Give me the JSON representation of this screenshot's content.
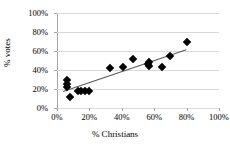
{
  "chart_data": {
    "type": "scatter",
    "title": "",
    "xlabel": "% Christians",
    "ylabel": "% votes",
    "xlim": [
      0,
      100
    ],
    "ylim": [
      0,
      100
    ],
    "xticks": [
      "0%",
      "20%",
      "40%",
      "60%",
      "80%",
      "100%"
    ],
    "yticks": [
      "0%",
      "20%",
      "40%",
      "60%",
      "80%",
      "100%"
    ],
    "xtick_values": [
      0,
      20,
      40,
      60,
      80,
      100
    ],
    "ytick_values": [
      0,
      20,
      40,
      60,
      80,
      100
    ],
    "grid": "horizontal",
    "legend": "none",
    "marker": "black-diamond",
    "points": [
      {
        "x": 6,
        "y": 29
      },
      {
        "x": 6,
        "y": 25
      },
      {
        "x": 6,
        "y": 22
      },
      {
        "x": 8,
        "y": 12
      },
      {
        "x": 13,
        "y": 18
      },
      {
        "x": 15,
        "y": 18
      },
      {
        "x": 17,
        "y": 18
      },
      {
        "x": 20,
        "y": 18
      },
      {
        "x": 33,
        "y": 42
      },
      {
        "x": 41,
        "y": 43
      },
      {
        "x": 47,
        "y": 52
      },
      {
        "x": 56,
        "y": 46
      },
      {
        "x": 57,
        "y": 44
      },
      {
        "x": 57,
        "y": 48
      },
      {
        "x": 65,
        "y": 43
      },
      {
        "x": 70,
        "y": 55
      },
      {
        "x": 80,
        "y": 69
      }
    ],
    "trendline": {
      "x0": 4,
      "y0": 18,
      "x1": 80,
      "y1": 62
    }
  }
}
